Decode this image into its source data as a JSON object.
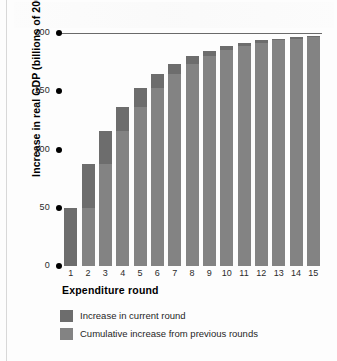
{
  "chart_data": {
    "type": "bar",
    "title": "",
    "xlabel": "Expenditure round",
    "ylabel": "Increase in real GDP (billions of 2002 dollars)",
    "categories": [
      "1",
      "2",
      "3",
      "4",
      "5",
      "6",
      "7",
      "8",
      "9",
      "10",
      "11",
      "12",
      "13",
      "14",
      "15"
    ],
    "ylim": [
      0,
      200
    ],
    "yticks": [
      0,
      50,
      100,
      150,
      200
    ],
    "ytick_labels": [
      "0",
      "50",
      "100",
      "150",
      "200"
    ],
    "grid": false,
    "legend_position": "below-axis-left",
    "stacked": true,
    "asymptote": 200,
    "series": [
      {
        "name": "Cumulative increase from previous rounds",
        "color": "#838383",
        "values": [
          0,
          50,
          87.5,
          115.6,
          136.7,
          152.6,
          164.4,
          173.3,
          180.0,
          185.0,
          188.7,
          191.5,
          193.6,
          195.2,
          196.4
        ]
      },
      {
        "name": "Increase in current round",
        "color": "#6d6d6d",
        "values": [
          50,
          37.5,
          28.1,
          21.1,
          15.8,
          11.9,
          8.9,
          6.7,
          5.0,
          3.8,
          2.8,
          2.1,
          1.6,
          1.2,
          0.9
        ]
      }
    ],
    "cumulative_totals": [
      50,
      87.5,
      115.6,
      136.7,
      152.6,
      164.4,
      173.3,
      180.0,
      185.0,
      188.7,
      191.5,
      193.6,
      195.2,
      196.4,
      197.3
    ]
  },
  "legend": {
    "items": [
      {
        "label": "Increase in current round",
        "swatch": "cur"
      },
      {
        "label": "Cumulative increase from previous rounds",
        "swatch": "prev"
      }
    ]
  },
  "colors": {
    "bar_current": "#6d6d6d",
    "bar_previous": "#838383",
    "axis_text": "#2b2b2b",
    "title_text": "#000000",
    "asymptote_line": "#6a6a6a"
  }
}
